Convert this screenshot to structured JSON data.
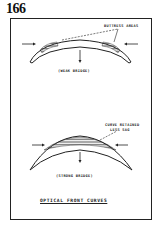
{
  "page_number": "166",
  "diagram": {
    "title": "OPTICAL FRONT CURVES",
    "top_figure": {
      "caption": "(WEAK BRIDGE)",
      "annotation": "BUTTRESS AREAS"
    },
    "bottom_figure": {
      "caption": "(STRONG BRIDGE)",
      "annotation_line1": "CURVE RETAINED",
      "annotation_line2": "LESS SAG"
    }
  }
}
